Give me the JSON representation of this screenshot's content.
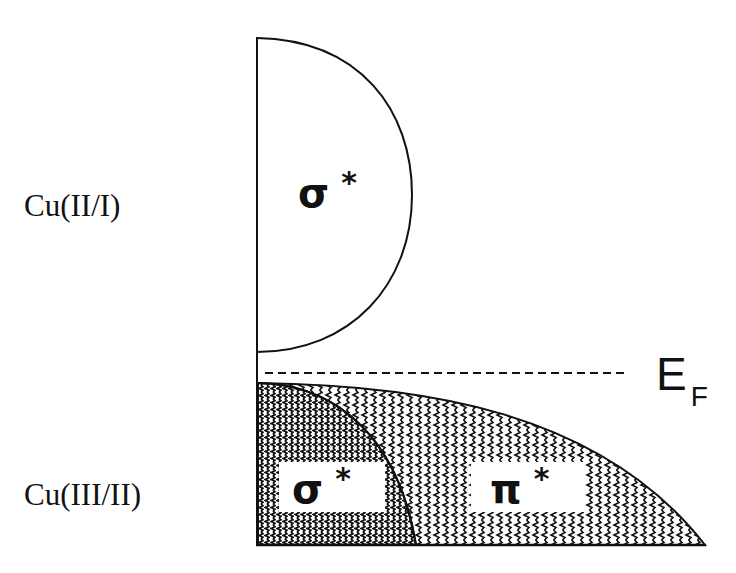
{
  "diagram": {
    "type": "band-structure-schematic",
    "levels": [
      {
        "label": "Cu(II/I)",
        "band": "σ*",
        "filled": false
      },
      {
        "label": "Cu(III/II)",
        "bands": [
          "σ*",
          "π*"
        ],
        "filled": true
      }
    ],
    "upper_label": "Cu(II/I)",
    "lower_label": "Cu(III/II)",
    "upper_band": {
      "symbol": "σ",
      "star": "*"
    },
    "lower_sigma_band": {
      "symbol": "σ",
      "star": "*"
    },
    "lower_pi_band": {
      "symbol": "π",
      "star": "*"
    },
    "fermi_level": {
      "main": "E",
      "subscript": "F"
    },
    "colors": {
      "line": "#111111",
      "background": "#ffffff",
      "fill_pattern": "#111111"
    }
  }
}
